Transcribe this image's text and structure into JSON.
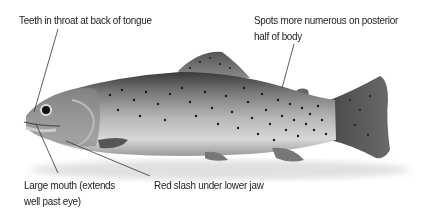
{
  "diagram": {
    "labels": {
      "teeth": "Teeth in throat at back of tongue",
      "spots_line1": "Spots more numerous on posterior",
      "spots_line2": "half of body",
      "mouth_line1": "Large mouth (extends",
      "mouth_line2": "well past eye)",
      "slash": "Red slash under lower jaw"
    },
    "colors": {
      "text": "#222222",
      "leader_line": "#333333",
      "background": "#ffffff"
    }
  }
}
